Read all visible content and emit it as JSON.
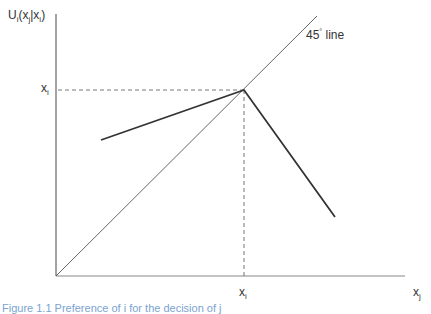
{
  "diagram": {
    "y_axis_label": {
      "main": "U",
      "sub1": "i",
      "mid": "(x",
      "sub2": "j",
      "bar": "|x",
      "sub3": "i",
      "end": ")"
    },
    "x_axis_label": {
      "main": "x",
      "sub": "j"
    },
    "y_tick_label": {
      "main": "x",
      "sub": "i"
    },
    "x_tick_label": {
      "main": "x",
      "sub": "i"
    },
    "line_annotation": {
      "text": "45",
      "degree": "°",
      "suffix": " line"
    },
    "caption": "Figure 1.1  Preference of  i for  the  decision of  j"
  },
  "geometry": {
    "origin": [
      56,
      276
    ],
    "y_axis_top": [
      56,
      14
    ],
    "x_axis_end": [
      405,
      276
    ],
    "diag_end": [
      317,
      16
    ],
    "peak": [
      244,
      90
    ],
    "left_start": [
      101,
      140
    ],
    "right_end": [
      335,
      217
    ]
  },
  "colors": {
    "axis": "#666666",
    "curve": "#333333",
    "diag": "#555555",
    "dash": "#666666"
  }
}
